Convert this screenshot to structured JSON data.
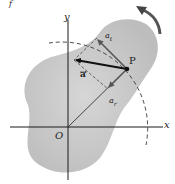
{
  "figure": {
    "type": "rigid-body-rotation-acceleration",
    "colors": {
      "body_fill": "#c8c8c8",
      "axis": "#1a1a1a",
      "vector": "#111111",
      "component": "#555555",
      "dashed": "#333333",
      "rotation_arrow": "#444444"
    },
    "labels": {
      "corner_mark": "f",
      "y_axis": "y",
      "x_axis": "x",
      "origin": "O",
      "point": "P",
      "accel": "a",
      "accel_t_base": "a",
      "accel_t_sub": "t",
      "accel_r_base": "a",
      "accel_r_sub": "r"
    },
    "points": {
      "origin": [
        68,
        127
      ],
      "P": [
        127,
        69
      ],
      "a_tip": [
        74,
        60
      ],
      "a_t_tip": [
        97,
        38
      ],
      "a_r_tip": [
        108,
        89
      ]
    }
  }
}
